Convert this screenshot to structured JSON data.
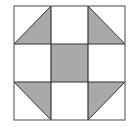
{
  "diagram": {
    "type": "quilt-block",
    "pattern": "shoo-fly",
    "grid": {
      "rows": 3,
      "cols": 3
    },
    "colors": {
      "background": "#ffffff",
      "shade": "#a9a9a9",
      "line": "#333333",
      "border": "#555555"
    },
    "cells": [
      {
        "row": 0,
        "col": 0,
        "fill": "half-triangle",
        "shaded_half": "lower-right"
      },
      {
        "row": 0,
        "col": 1,
        "fill": "none"
      },
      {
        "row": 0,
        "col": 2,
        "fill": "half-triangle",
        "shaded_half": "lower-left"
      },
      {
        "row": 1,
        "col": 0,
        "fill": "none"
      },
      {
        "row": 1,
        "col": 1,
        "fill": "solid"
      },
      {
        "row": 1,
        "col": 2,
        "fill": "none"
      },
      {
        "row": 2,
        "col": 0,
        "fill": "half-triangle",
        "shaded_half": "upper-right"
      },
      {
        "row": 2,
        "col": 1,
        "fill": "none"
      },
      {
        "row": 2,
        "col": 2,
        "fill": "half-triangle",
        "shaded_half": "upper-left"
      }
    ]
  }
}
